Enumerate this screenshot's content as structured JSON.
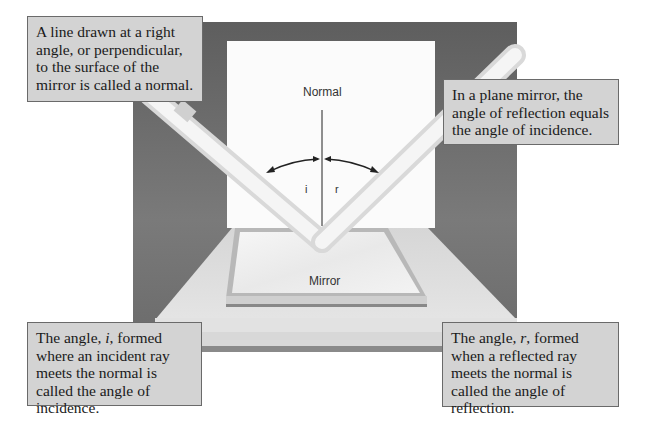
{
  "diagram": {
    "labels": {
      "normal": "Normal",
      "mirror": "Mirror",
      "angle_i": "i",
      "angle_r": "r"
    },
    "callouts": {
      "top_left": "A line drawn at a right angle, or perpendicular, to the surface of the mirror is called a normal.",
      "top_right": "In a plane mirror, the angle of reflection equals the angle of incidence.",
      "bottom_left": {
        "pre": "The angle, ",
        "var": "i",
        "post": ", formed where an incident ray meets the normal is called the angle of incidence."
      },
      "bottom_right": {
        "pre": "The angle, ",
        "var": "r",
        "post": ", formed when a reflected ray meets the normal is called the angle of reflection."
      }
    },
    "colors": {
      "backdrop": "#6e6e6e",
      "board": "#fbfbfb",
      "callout_bg": "#d3d3d3",
      "callout_border": "#6a6a6a",
      "ray": "#f4f4f4",
      "table": "#dcdcdc"
    }
  }
}
